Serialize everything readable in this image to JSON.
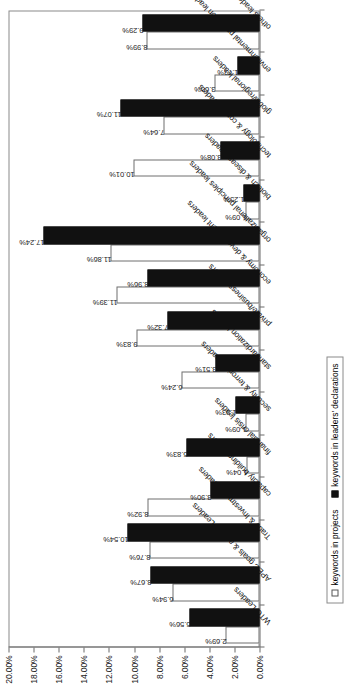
{
  "chart_data": {
    "type": "bar",
    "title": "",
    "subtitle": "",
    "xlabel": "",
    "ylabel": "",
    "ylim": [
      0,
      20
    ],
    "ytick_labels": [
      "20.00%",
      "18.00%",
      "16.00%",
      "14.00%",
      "12.00%",
      "10.00%",
      "8.00%",
      "6.00%",
      "4.00%",
      "2.00%",
      "0.00%"
    ],
    "ytick_values": [
      20,
      18,
      16,
      14,
      12,
      10,
      8,
      6,
      4,
      2,
      0
    ],
    "grid": false,
    "legend_position": "bottom-left",
    "orientation": "vertical-bars-figure-rotated-90",
    "categories": [
      "WTO Leaders",
      "APEC goals & actions Leaders",
      "Trade & Investment Leaders",
      "capacity building leaders",
      "financial crisis leaders",
      "security & terrorism leaders",
      "standardization leaders",
      "private/business leaders",
      "economy & development leaders",
      "organizational principles leaders",
      "biotech & disease leaders",
      "technology & comm. leaders",
      "global/regional leaders",
      "environmental protection leaders",
      "others leaders"
    ],
    "series": [
      {
        "name": "keywords in projects",
        "color": "#ffffff",
        "values": [
          2.69,
          6.94,
          8.76,
          8.92,
          1.04,
          1.09,
          6.24,
          9.83,
          11.39,
          11.86,
          1.09,
          10.01,
          7.64,
          3.6,
          8.99
        ],
        "labels": [
          "2.69%",
          "6.94%",
          "8.76%",
          "8.92%",
          "1.04%",
          "1.09%",
          "6.24%",
          "9.83%",
          "11.39%",
          "11.86%",
          "1.09%",
          "10.01%",
          "7.64%",
          "3.60%",
          "8.99%"
        ]
      },
      {
        "name": "keywords in leaders' declarations",
        "color": "#111111",
        "values": [
          5.56,
          8.67,
          10.54,
          3.9,
          5.83,
          1.93,
          3.51,
          7.32,
          8.96,
          17.24,
          1.25,
          3.08,
          11.07,
          1.73,
          9.29
        ],
        "labels": [
          "5.56%",
          "8.67%",
          "10.54%",
          "3.90%",
          "5.83%",
          "1.93%",
          "3.51%",
          "7.32%",
          "8.96%",
          "17.24%",
          "1.25%",
          "3.08%",
          "11.07%",
          "1.73%",
          "9.29%"
        ]
      }
    ]
  },
  "legend": {
    "items": [
      {
        "label": "keywords in projects",
        "swatch": "hollow-square-icon"
      },
      {
        "label": "keywords in leaders' declarations",
        "swatch": "filled-square-icon"
      }
    ]
  }
}
